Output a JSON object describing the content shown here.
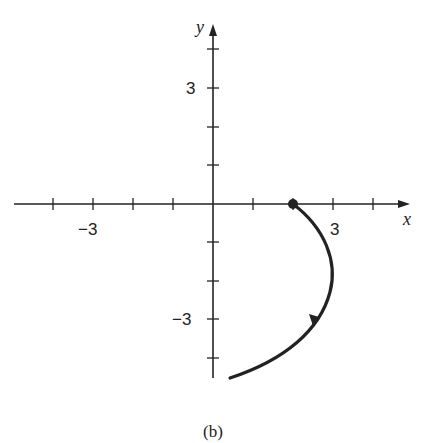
{
  "figure": {
    "caption": "(b)",
    "x_axis": {
      "label": "x",
      "tick_labels": [
        {
          "value": -3,
          "text": "−3"
        },
        {
          "value": 3,
          "text": "3"
        }
      ],
      "range": [
        -5,
        5
      ]
    },
    "y_axis": {
      "label": "y",
      "tick_labels": [
        {
          "value": 3,
          "text": "3"
        },
        {
          "value": -3,
          "text": "−3"
        }
      ],
      "range": [
        -4.5,
        4
      ]
    },
    "curve": {
      "description": "Parametric curve starting at point (2, 0), bulging right to about x=3, then heading down-left to about (0.5, -4.5)",
      "start_point": [
        2,
        0
      ],
      "end_point": [
        0.5,
        -4.5
      ],
      "direction": "clockwise / downward",
      "color": "#222222"
    },
    "colors": {
      "ink": "#222222",
      "background": "#ffffff"
    }
  }
}
